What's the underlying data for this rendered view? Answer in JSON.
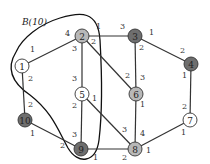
{
  "diagram": {
    "region_label": "B(10)",
    "colors": {
      "white": "#ffffff",
      "light": "#b8b8b8",
      "dark": "#6e6e6e",
      "edge": "#333333"
    },
    "nodes": [
      {
        "id": "1",
        "label": "1",
        "x": 22,
        "y": 66,
        "fill": "white"
      },
      {
        "id": "2",
        "label": "2",
        "x": 82,
        "y": 36,
        "fill": "light"
      },
      {
        "id": "3",
        "label": "3",
        "x": 135,
        "y": 36,
        "fill": "dark"
      },
      {
        "id": "4",
        "label": "4",
        "x": 191,
        "y": 64,
        "fill": "dark"
      },
      {
        "id": "5",
        "label": "5",
        "x": 82,
        "y": 94,
        "fill": "white"
      },
      {
        "id": "6",
        "label": "6",
        "x": 136,
        "y": 94,
        "fill": "light"
      },
      {
        "id": "7",
        "label": "7",
        "x": 190,
        "y": 120,
        "fill": "white"
      },
      {
        "id": "8",
        "label": "8",
        "x": 135,
        "y": 149,
        "fill": "light"
      },
      {
        "id": "9",
        "label": "9",
        "x": 81,
        "y": 149,
        "fill": "dark"
      },
      {
        "id": "10",
        "label": "10",
        "x": 25,
        "y": 120,
        "fill": "dark"
      }
    ],
    "edges": [
      {
        "from": "1",
        "to": "2",
        "w_from": "1",
        "w_to": "4"
      },
      {
        "from": "1",
        "to": "10",
        "w_from": "2",
        "w_to": "2"
      },
      {
        "from": "2",
        "to": "3",
        "w_from": "1",
        "w_to": "3"
      },
      {
        "from": "2",
        "to": "5",
        "w_from": "3",
        "w_to": "3"
      },
      {
        "from": "2",
        "to": "6",
        "w_from": "2",
        "w_to": "2"
      },
      {
        "from": "3",
        "to": "4",
        "w_from": "1",
        "w_to": "2"
      },
      {
        "from": "3",
        "to": "6",
        "w_from": "2",
        "w_to": "3"
      },
      {
        "from": "4",
        "to": "7",
        "w_from": "1",
        "w_to": "2"
      },
      {
        "from": "5",
        "to": "9",
        "w_from": "2",
        "w_to": "3"
      },
      {
        "from": "5",
        "to": "8",
        "w_from": "1",
        "w_to": "3"
      },
      {
        "from": "6",
        "to": "8",
        "w_from": "1",
        "w_to": "4"
      },
      {
        "from": "7",
        "to": "8",
        "w_from": "1",
        "w_to": "1"
      },
      {
        "from": "10",
        "to": "9",
        "w_from": "1",
        "w_to": "2"
      },
      {
        "from": "9",
        "to": "8",
        "w_from": "1",
        "w_to": "2"
      }
    ],
    "weight_labels": [
      {
        "text": "1",
        "x": 30,
        "y": 52
      },
      {
        "text": "4",
        "x": 65,
        "y": 36
      },
      {
        "text": "2",
        "x": 28,
        "y": 81
      },
      {
        "text": "2",
        "x": 28,
        "y": 107
      },
      {
        "text": "1",
        "x": 96,
        "y": 29
      },
      {
        "text": "3",
        "x": 120,
        "y": 29
      },
      {
        "text": "3",
        "x": 72,
        "y": 51
      },
      {
        "text": "3",
        "x": 72,
        "y": 81
      },
      {
        "text": "2",
        "x": 91,
        "y": 44
      },
      {
        "text": "2",
        "x": 125,
        "y": 78
      },
      {
        "text": "1",
        "x": 149,
        "y": 35
      },
      {
        "text": "2",
        "x": 180,
        "y": 53
      },
      {
        "text": "2",
        "x": 139,
        "y": 50
      },
      {
        "text": "3",
        "x": 140,
        "y": 80
      },
      {
        "text": "1",
        "x": 182,
        "y": 78
      },
      {
        "text": "2",
        "x": 182,
        "y": 109
      },
      {
        "text": "2",
        "x": 72,
        "y": 108
      },
      {
        "text": "3",
        "x": 72,
        "y": 137
      },
      {
        "text": "1",
        "x": 92,
        "y": 101
      },
      {
        "text": "3",
        "x": 122,
        "y": 132
      },
      {
        "text": "1",
        "x": 140,
        "y": 107
      },
      {
        "text": "4",
        "x": 140,
        "y": 136
      },
      {
        "text": "1",
        "x": 181,
        "y": 135
      },
      {
        "text": "1",
        "x": 146,
        "y": 153
      },
      {
        "text": "1",
        "x": 30,
        "y": 136
      },
      {
        "text": "2",
        "x": 60,
        "y": 148
      },
      {
        "text": "1",
        "x": 93,
        "y": 160
      },
      {
        "text": "2",
        "x": 122,
        "y": 160
      }
    ]
  }
}
